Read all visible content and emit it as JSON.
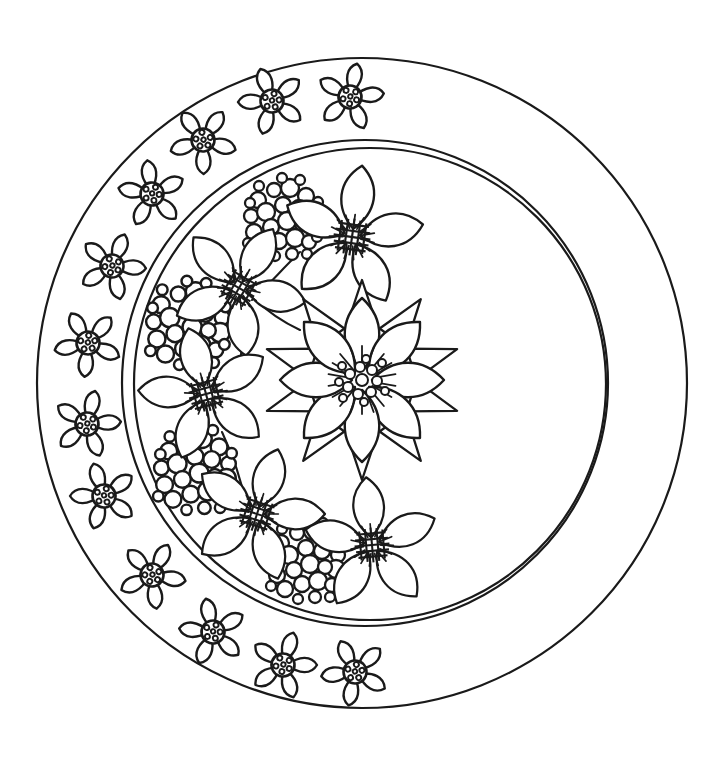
{
  "artwork": {
    "title": "Floral Mandala Coloring Page",
    "type": "line-art-coloring-page",
    "canvas": {
      "width": 713,
      "height": 757
    },
    "colors": {
      "background": "#ffffff",
      "stroke": "#1a1a1a"
    }
  },
  "rings": [
    {
      "name": "outer-ring-circle",
      "cx": 362,
      "cy": 383,
      "r": 325,
      "stroke_width": 2.2
    },
    {
      "name": "middle-ring-circle",
      "cx": 365,
      "cy": 383,
      "r": 243,
      "stroke_width": 2.2
    },
    {
      "name": "inner-ring-circle",
      "cx": 370,
      "cy": 384,
      "r": 236,
      "stroke_width": 2.2
    }
  ],
  "border_flowers": {
    "name": "border-small-flowers",
    "count": 16,
    "description": "five-pointed small flowers with dotted circular centers arranged along the left arc between outer and middle circles",
    "petal_count": 5,
    "center_dots": 6,
    "items": [
      {
        "cx": 350,
        "cy": 97,
        "r": 34,
        "rot": 12
      },
      {
        "cx": 272,
        "cy": 101,
        "r": 34,
        "rot": -20
      },
      {
        "cx": 203,
        "cy": 140,
        "r": 34,
        "rot": 35
      },
      {
        "cx": 152,
        "cy": 194,
        "r": 33,
        "rot": -8
      },
      {
        "cx": 112,
        "cy": 266,
        "r": 33,
        "rot": 22
      },
      {
        "cx": 88,
        "cy": 343,
        "r": 33,
        "rot": -30
      },
      {
        "cx": 87,
        "cy": 424,
        "r": 33,
        "rot": 14
      },
      {
        "cx": 104,
        "cy": 496,
        "r": 33,
        "rot": -18
      },
      {
        "cx": 152,
        "cy": 575,
        "r": 34,
        "rot": 28
      },
      {
        "cx": 213,
        "cy": 632,
        "r": 34,
        "rot": -12
      },
      {
        "cx": 283,
        "cy": 665,
        "r": 34,
        "rot": 18
      },
      {
        "cx": 355,
        "cy": 672,
        "r": 34,
        "rot": -25
      }
    ]
  },
  "inner_flowers": {
    "name": "inner-large-flowers",
    "description": "six five-petal flowers with spiky cross-hatched centers forming a crescent inside the inner circle",
    "items": [
      {
        "id": "flower-top-right",
        "cx": 352,
        "cy": 237,
        "r": 72,
        "rot": 8,
        "petals": 5
      },
      {
        "id": "flower-upper-left",
        "cx": 239,
        "cy": 288,
        "r": 68,
        "rot": 30,
        "petals": 5
      },
      {
        "id": "flower-mid-left",
        "cx": 206,
        "cy": 394,
        "r": 68,
        "rot": -15,
        "petals": 5
      },
      {
        "id": "flower-lower-left",
        "cx": 257,
        "cy": 514,
        "r": 68,
        "rot": 18,
        "petals": 5
      },
      {
        "id": "flower-bottom",
        "cx": 372,
        "cy": 545,
        "r": 68,
        "rot": -5,
        "petals": 5
      }
    ]
  },
  "center_flower": {
    "name": "center-large-flower",
    "cx": 362,
    "cy": 380,
    "front_petals": 8,
    "back_petals": 10,
    "front_radius": 82,
    "back_radius": 100,
    "description": "large double-layered flower with eight rounded front petals over ten pointed back petals and a dense dotted spiky center"
  },
  "berry_clusters": {
    "name": "berry-clusters",
    "description": "clusters of circles of varying sizes representing berries",
    "items": [
      {
        "id": "berries-top",
        "cx": 284,
        "cy": 218,
        "r": 42
      },
      {
        "id": "berries-left",
        "cx": 189,
        "cy": 324,
        "r": 45
      },
      {
        "id": "berries-lower",
        "cx": 196,
        "cy": 470,
        "r": 44
      },
      {
        "id": "berries-bottom",
        "cx": 307,
        "cy": 561,
        "r": 42
      }
    ]
  },
  "stems": {
    "name": "connecting-stems",
    "description": "thin curved lines linking the inner flowers into a vine"
  }
}
